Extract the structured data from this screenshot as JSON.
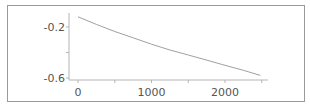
{
  "chart_data": {
    "type": "line",
    "title": "",
    "xlabel": "",
    "ylabel": "",
    "xlim": [
      0,
      2550
    ],
    "ylim": [
      -0.6,
      -0.1
    ],
    "grid": false,
    "legend": null,
    "x_ticks": [
      0,
      1000,
      2000
    ],
    "x_tick_labels": [
      "0",
      "1000",
      "2000"
    ],
    "x_minor_ticks": [
      500,
      1500,
      2500
    ],
    "y_ticks": [
      -0.2,
      -0.6
    ],
    "y_tick_labels": [
      "-0.2",
      "-0.6"
    ],
    "y_minor_ticks": [
      -0.4
    ],
    "series": [
      {
        "name": "curve",
        "color": "#a0a0a0",
        "x": [
          0,
          250,
          500,
          750,
          1000,
          1250,
          1500,
          1750,
          2000,
          2250,
          2480
        ],
        "y": [
          -0.12,
          -0.18,
          -0.235,
          -0.285,
          -0.335,
          -0.38,
          -0.42,
          -0.46,
          -0.5,
          -0.54,
          -0.58
        ]
      }
    ]
  },
  "colors": {
    "frame": "#9a9a9a",
    "axis": "#b5b5b5",
    "line": "#a0a0a0",
    "text": "#555555"
  }
}
